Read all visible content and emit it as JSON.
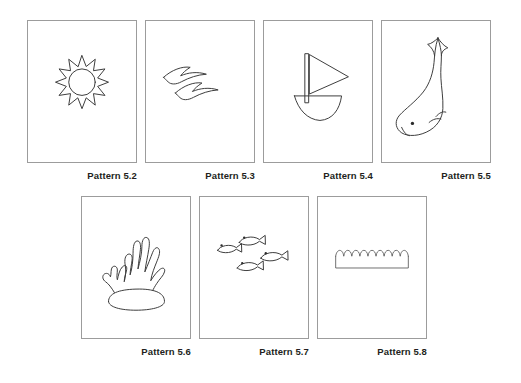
{
  "page": {
    "background_color": "#ffffff",
    "card_border_color": "#9c9c9c",
    "ink_color": "#3a3a3a",
    "label_color": "#231f20"
  },
  "rows": [
    {
      "name": "top-row",
      "cards": [
        {
          "id": "pattern-5-2",
          "label": "Pattern 5.2",
          "motif": "sun",
          "motif_name": "sun-icon",
          "x": 27,
          "y": 20,
          "w": 110,
          "h": 143,
          "label_x": 27,
          "label_w": 110,
          "label_y": 170
        },
        {
          "id": "pattern-5-3",
          "label": "Pattern 5.3",
          "motif": "seagulls",
          "motif_name": "seagulls-icon",
          "x": 145,
          "y": 20,
          "w": 110,
          "h": 143,
          "label_x": 145,
          "label_w": 110,
          "label_y": 170
        },
        {
          "id": "pattern-5-4",
          "label": "Pattern 5.4",
          "motif": "sailboat",
          "motif_name": "sailboat-icon",
          "x": 263,
          "y": 20,
          "w": 110,
          "h": 143,
          "label_x": 263,
          "label_w": 110,
          "label_y": 170
        },
        {
          "id": "pattern-5-5",
          "label": "Pattern 5.5",
          "motif": "whale",
          "motif_name": "whale-icon",
          "x": 381,
          "y": 20,
          "w": 110,
          "h": 143,
          "label_x": 381,
          "label_w": 110,
          "label_y": 170
        }
      ]
    },
    {
      "name": "bottom-row",
      "cards": [
        {
          "id": "pattern-5-6",
          "label": "Pattern 5.6",
          "motif": "coral",
          "motif_name": "coral-icon",
          "x": 81,
          "y": 196,
          "w": 110,
          "h": 143,
          "label_x": 81,
          "label_w": 110,
          "label_y": 346
        },
        {
          "id": "pattern-5-7",
          "label": "Pattern 5.7",
          "motif": "fish-school",
          "motif_name": "fish-school-icon",
          "x": 199,
          "y": 196,
          "w": 110,
          "h": 143,
          "label_x": 199,
          "label_w": 110,
          "label_y": 346
        },
        {
          "id": "pattern-5-8",
          "label": "Pattern 5.8",
          "motif": "waves-band",
          "motif_name": "waves-band-icon",
          "x": 317,
          "y": 196,
          "w": 110,
          "h": 143,
          "label_x": 317,
          "label_w": 110,
          "label_y": 346
        }
      ]
    }
  ]
}
